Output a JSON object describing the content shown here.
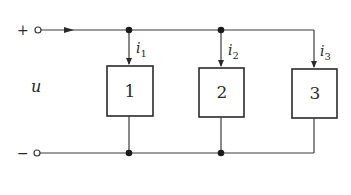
{
  "diagram": {
    "type": "parallel-circuit",
    "terminals": {
      "positive": {
        "sign": "+"
      },
      "negative": {
        "sign": "−"
      }
    },
    "voltage_label": "u",
    "branches": [
      {
        "element_label": "1",
        "current_label": "i",
        "current_subscript": "1"
      },
      {
        "element_label": "2",
        "current_label": "i",
        "current_subscript": "2"
      },
      {
        "element_label": "3",
        "current_label": "i",
        "current_subscript": "3"
      }
    ],
    "colors": {
      "line": "#3a3a3a",
      "node": "#1a1a1a",
      "background": "#ffffff"
    }
  }
}
